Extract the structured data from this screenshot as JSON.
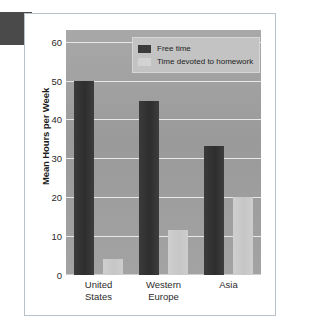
{
  "figure": {
    "y_axis_title": "Mean Hours per Week",
    "corner_tab_name": "page-tab-marker"
  },
  "legend": {
    "position": "top-center-right",
    "entries": [
      {
        "label": "Free time",
        "color": "#3a3a3a",
        "swatch_name": "legend-swatch-free-time"
      },
      {
        "label": "Time devoted to homework",
        "color": "#d2d2d2",
        "swatch_name": "legend-swatch-homework"
      }
    ]
  },
  "chart_data": {
    "type": "bar",
    "title": "",
    "subtitle": "",
    "xlabel": "",
    "ylabel": "Mean Hours per Week",
    "ylim": [
      0,
      63
    ],
    "yticks": [
      0,
      10,
      20,
      30,
      40,
      50,
      60
    ],
    "ytick_labels": [
      "0",
      "10",
      "20",
      "30",
      "40",
      "50",
      "60"
    ],
    "grid": true,
    "grid_axis": "y",
    "legend_position": "top-right",
    "categories": [
      "United States",
      "Western Europe",
      "Asia"
    ],
    "category_label_lines": [
      [
        "United",
        "States"
      ],
      [
        "Western",
        "Europe"
      ],
      [
        "Asia",
        ""
      ]
    ],
    "series": [
      {
        "name": "Free time",
        "color": "#3a3a3a",
        "values": [
          49.8,
          44.8,
          33.2
        ]
      },
      {
        "name": "Time devoted to homework",
        "color": "#cdcdcd",
        "values": [
          4.0,
          11.5,
          20.0
        ]
      }
    ],
    "plot_background": "#9d9d9d",
    "gridline_color": "#e8e8e8"
  }
}
